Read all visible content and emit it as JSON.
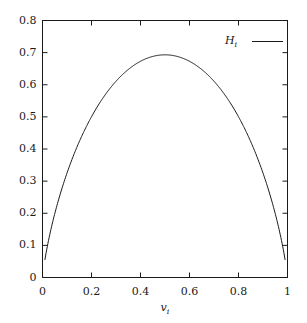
{
  "chart_data": {
    "type": "line",
    "title": "",
    "subtitle": "",
    "xlabel": "v_i",
    "ylabel": "",
    "xlabel_base": "v",
    "xlabel_sub": "i",
    "xlim": [
      0,
      1
    ],
    "ylim": [
      0,
      0.8
    ],
    "grid": false,
    "legend_position": "top-right",
    "frame": "box",
    "tick_direction": "in",
    "line_color": "#1a1a1a",
    "background_color": "#ffffff",
    "xticks": [
      0,
      0.2,
      0.4,
      0.6,
      0.8,
      1
    ],
    "xtick_labels": [
      "0",
      "0.2",
      "0.4",
      "0.6",
      "0.8",
      "1"
    ],
    "yticks": [
      0,
      0.1,
      0.2,
      0.3,
      0.4,
      0.5,
      0.6,
      0.7,
      0.8
    ],
    "ytick_labels": [
      "0",
      "0.1",
      "0.2",
      "0.3",
      "0.4",
      "0.5",
      "0.6",
      "0.7",
      "0.8"
    ],
    "series": [
      {
        "name": "H_i",
        "name_base": "H",
        "name_sub": "i",
        "color": "#1a1a1a",
        "x": [
          0.01,
          0.02,
          0.03,
          0.04,
          0.05,
          0.06,
          0.08,
          0.1,
          0.12,
          0.15,
          0.18,
          0.2,
          0.25,
          0.3,
          0.35,
          0.4,
          0.45,
          0.5,
          0.55,
          0.6,
          0.65,
          0.7,
          0.75,
          0.8,
          0.82,
          0.85,
          0.88,
          0.9,
          0.92,
          0.94,
          0.95,
          0.96,
          0.97,
          0.98,
          0.99
        ],
        "y": [
          0.056,
          0.098,
          0.135,
          0.168,
          0.199,
          0.227,
          0.279,
          0.325,
          0.367,
          0.423,
          0.473,
          0.5,
          0.562,
          0.611,
          0.647,
          0.673,
          0.688,
          0.693,
          0.688,
          0.673,
          0.647,
          0.611,
          0.562,
          0.5,
          0.473,
          0.423,
          0.367,
          0.325,
          0.279,
          0.227,
          0.199,
          0.168,
          0.135,
          0.098,
          0.056
        ]
      }
    ],
    "annotations": [],
    "peak": {
      "x": 0.5,
      "y": 0.693
    }
  },
  "legend": {
    "entries": [
      {
        "label_base": "H",
        "label_sub": "i"
      }
    ]
  },
  "axes": {
    "x_title_base": "v",
    "x_title_sub": "i"
  }
}
